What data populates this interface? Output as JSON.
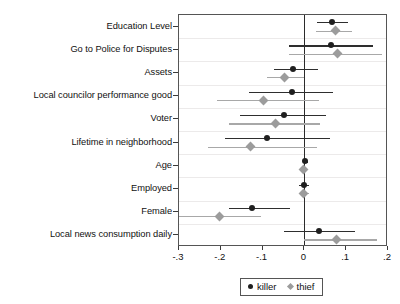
{
  "chart_data": {
    "type": "scatter",
    "title": "",
    "subtitle": "",
    "xlabel": "",
    "ylabel": "",
    "xlim": [
      -0.3,
      0.2
    ],
    "ylim": [
      0,
      10
    ],
    "grid": true,
    "grid_axis": "y",
    "zero_reference_line": 0,
    "legend_position": "bottom-center",
    "xticks": [
      -0.3,
      -0.2,
      -0.1,
      0,
      0.1,
      0.2
    ],
    "xticklabels": [
      "-.3",
      "-.2",
      "-.1",
      "0",
      ".1",
      ".2"
    ],
    "categories": [
      "Education Level",
      "Go to Police for Disputes",
      "Assets",
      "Local councilor performance good",
      "Voter",
      "Lifetime in neighborhood",
      "Age",
      "Employed",
      "Female",
      "Local news consumption daily"
    ],
    "series": [
      {
        "name": "killer",
        "marker": "circle",
        "color": "#1f1f1f",
        "values": [
          0.067,
          0.064,
          -0.028,
          -0.03,
          -0.05,
          -0.09,
          0.002,
          0.0,
          -0.126,
          0.034
        ],
        "ci_low": [
          0.031,
          -0.038,
          -0.072,
          -0.133,
          -0.154,
          -0.19,
          -0.004,
          -0.012,
          -0.18,
          -0.049
        ],
        "ci_high": [
          0.105,
          0.164,
          0.033,
          0.069,
          0.051,
          0.062,
          0.008,
          0.012,
          -0.034,
          0.121
        ]
      },
      {
        "name": "thief",
        "marker": "diamond",
        "color": "#9c9c9c",
        "values": [
          0.074,
          0.079,
          -0.048,
          -0.098,
          -0.07,
          -0.128,
          -0.002,
          -0.002,
          -0.203,
          0.077
        ],
        "ci_low": [
          0.028,
          -0.038,
          -0.09,
          -0.208,
          -0.18,
          -0.231,
          -0.008,
          -0.014,
          -0.3,
          0.0
        ],
        "ci_high": [
          0.115,
          0.185,
          -0.001,
          0.035,
          0.038,
          0.03,
          0.006,
          0.01,
          -0.105,
          0.174
        ]
      }
    ],
    "legend": [
      {
        "label": "killer",
        "marker": "circle",
        "color": "#1f1f1f"
      },
      {
        "label": "thief",
        "marker": "diamond",
        "color": "#9c9c9c"
      }
    ]
  }
}
